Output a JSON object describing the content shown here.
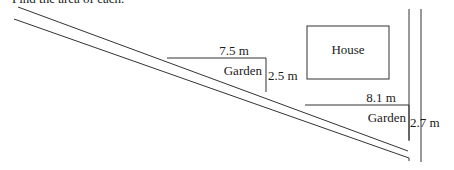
{
  "header": {
    "text": "Find the area of each."
  },
  "diagram": {
    "house_label": "House",
    "gardens": [
      {
        "label": "Garden",
        "width": "7.5 m",
        "height": "2.5 m"
      },
      {
        "label": "Garden",
        "width": "8.1 m",
        "height": "2.7 m"
      }
    ]
  }
}
